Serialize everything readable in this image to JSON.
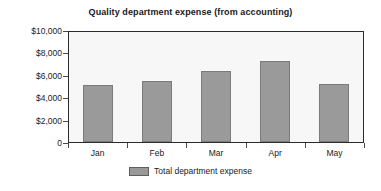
{
  "chart_data": {
    "type": "bar",
    "title": "Quality department expense (from accounting)",
    "xlabel": "",
    "ylabel": "",
    "categories": [
      "Jan",
      "Feb",
      "Mar",
      "Apr",
      "May"
    ],
    "series": [
      {
        "name": "Total department expense",
        "values": [
          5100,
          5450,
          6350,
          7200,
          5200
        ]
      }
    ],
    "ytick_labels": [
      "$10,000",
      "$8,000",
      "$6,000",
      "$4,000",
      "$2,000",
      "0"
    ],
    "ytick_values": [
      10000,
      8000,
      6000,
      4000,
      2000,
      0
    ],
    "ylim": [
      0,
      10000
    ],
    "grid": false,
    "legend_position": "bottom",
    "colors": {
      "bar_fill": "#9a9a9a",
      "bar_border": "#7b7b7b",
      "plot_background": "#f7f7f7",
      "plot_border": "#2b2b2b",
      "text": "#1a1a1a",
      "page_background": "#ffffff"
    }
  },
  "legend": {
    "entries": [
      {
        "label": "Total department expense"
      }
    ]
  }
}
